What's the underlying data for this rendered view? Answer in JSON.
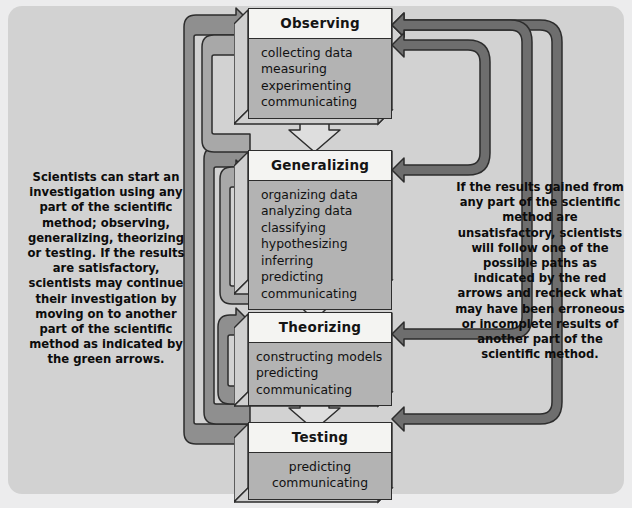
{
  "diagram": {
    "title": "The Scientific Method",
    "background_color": "#d2d2d2",
    "page_color": "#ececed",
    "green_arrow_color": "#8f8f8f",
    "red_arrow_color": "#6e6e6e",
    "outline_color": "#2d2d2d",
    "box_header_color": "#f4f4f2",
    "box_body_color": "#b3b3b3"
  },
  "stages": [
    {
      "id": "observing",
      "title": "Observing",
      "items": [
        "collecting data",
        "measuring",
        "experimenting",
        "communicating"
      ],
      "align": "left"
    },
    {
      "id": "generalizing",
      "title": "Generalizing",
      "items": [
        "organizing data",
        "analyzing data",
        "classifying",
        "hypothesizing",
        "inferring",
        "predicting",
        "communicating"
      ],
      "align": "left"
    },
    {
      "id": "theorizing",
      "title": "Theorizing",
      "items": [
        "constructing models",
        "predicting",
        "communicating"
      ],
      "align": "left"
    },
    {
      "id": "testing",
      "title": "Testing",
      "items": [
        "predicting",
        "communicating"
      ],
      "align": "center"
    }
  ],
  "annotations": {
    "left": "Scientists can start an investigation using any part of the scientific method; observing, generalizing, theorizing or testing. If the results are satisfactory, scientists may continue their investigation by moving on to another part of the scientific method as indicated by the green arrows.",
    "right": "If the results gained from any part of the scientific method are unsatisfactory, scientists will follow one of the possible paths as indicated by the red arrows and recheck what may have been erroneous or incomplete results of another part of the scientific method."
  },
  "flow": {
    "forward_arrows": [
      {
        "from": "observing",
        "to": "generalizing",
        "direction": "down",
        "style": "outline"
      },
      {
        "from": "generalizing",
        "to": "theorizing",
        "direction": "down",
        "style": "outline"
      },
      {
        "from": "theorizing",
        "to": "testing",
        "direction": "down",
        "style": "outline"
      }
    ],
    "green_arrows": [
      {
        "from": "testing",
        "to": "observing",
        "side": "left"
      },
      {
        "from": "testing",
        "to": "generalizing",
        "side": "left"
      },
      {
        "from": "testing",
        "to": "theorizing",
        "side": "left"
      },
      {
        "from": "generalizing",
        "to": "observing",
        "side": "left"
      },
      {
        "from": "theorizing",
        "to": "generalizing",
        "side": "left"
      }
    ],
    "red_arrows": [
      {
        "from": "generalizing",
        "to": "observing",
        "side": "right"
      },
      {
        "from": "theorizing",
        "to": "observing",
        "side": "right"
      },
      {
        "from": "testing",
        "to": "observing",
        "side": "right"
      }
    ]
  }
}
